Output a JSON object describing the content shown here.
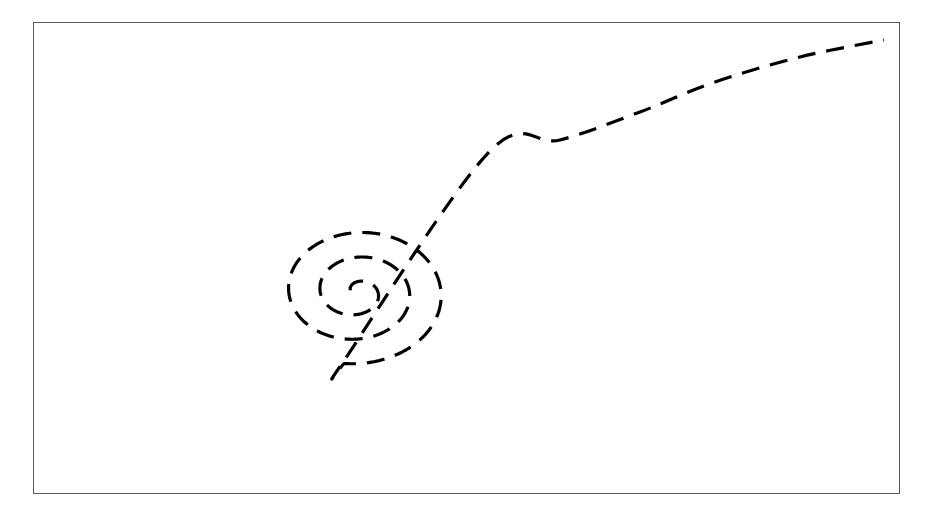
{
  "figure": {
    "title": "",
    "background_color": "#ffffff",
    "width": 926,
    "height": 522
  },
  "frame": {
    "name": "plot-border",
    "x": 33,
    "y": 22,
    "width": 867,
    "height": 472,
    "border_color": "#5a5a5a",
    "border_width": 1.6,
    "fill": "#ffffff"
  },
  "chart_data": {
    "type": "line",
    "title": "",
    "subtitle": "",
    "xlabel": "",
    "ylabel": "",
    "grid": false,
    "legend": null,
    "axes_visible": false,
    "tick_labels_x": [],
    "tick_labels_y": [],
    "xlim": [
      33,
      900
    ],
    "ylim": [
      22,
      494
    ],
    "series": [
      {
        "name": "dashed-spiral",
        "style": "dashed",
        "color": "#000000",
        "line_width": 3.2,
        "dash_pattern": [
          18,
          11
        ],
        "cap": "butt",
        "description": "Archimedean spiral unwinding outward from a tight centre, then leaving as a rising tail toward the upper-right corner.",
        "spiral": {
          "center_x": 357,
          "center_y": 292,
          "start_angle_deg": 200,
          "turns": 2.72,
          "a_radius": 7,
          "b_growth": 31.5,
          "y_squash": 0.78,
          "samples": 900
        },
        "tail": {
          "control_points": [
            [
              489,
              152
            ],
            [
              560,
              140
            ],
            [
              640,
              112
            ],
            [
              712,
              83
            ],
            [
              800,
              57
            ],
            [
              884,
              40
            ]
          ],
          "end_point": [
            884,
            40
          ]
        },
        "extremes": {
          "leftmost_x": 48,
          "rightmost_x": 588,
          "topmost_y": 120,
          "bottommost_y": 482,
          "inner_curl_end": [
            358,
            297
          ]
        }
      }
    ]
  }
}
